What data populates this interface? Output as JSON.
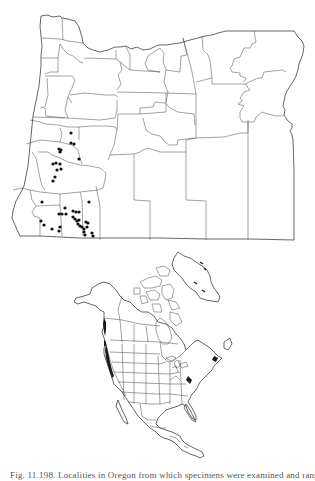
{
  "figure": {
    "caption": "Fig. 11.198. Localities in Oregon from which specimens were examined and range f",
    "panels": [
      {
        "id": "oregon-map",
        "description": "Oregon county outline map with locality dots",
        "marker": "filled-circle",
        "marker_color": "#111111"
      },
      {
        "id": "north-america-map",
        "description": "North America map with shaded Pacific coast range",
        "range_color": "#1a1a1a"
      }
    ],
    "line_color": "#333333",
    "background": "#ffffff"
  }
}
